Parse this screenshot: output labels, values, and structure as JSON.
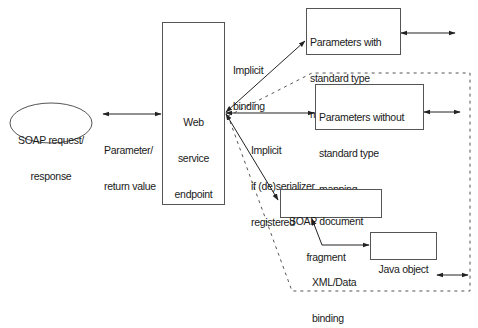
{
  "diagram": {
    "nodes": {
      "soap_request": {
        "label_line1": "SOAP request/",
        "label_line2": "response",
        "shape": "ellipse"
      },
      "endpoint": {
        "label_line1": "Web",
        "label_line2": "service",
        "label_line3": "endpoint",
        "shape": "rect"
      },
      "params_standard": {
        "label_line1": "Parameters with",
        "label_line2": "standard type",
        "label_line3": "mapping",
        "shape": "rect"
      },
      "params_nonstandard": {
        "label_line1": "Parameters without",
        "label_line2": "standard type",
        "label_line3": "mapping",
        "shape": "rect"
      },
      "soap_fragment": {
        "label_line1": "SOAP document",
        "label_line2": "fragment",
        "shape": "rect"
      },
      "java_object": {
        "label_line1": "Java object",
        "shape": "rect"
      }
    },
    "edges": {
      "soap_to_endpoint": {
        "label_line1": "Parameter/",
        "label_line2": "return value",
        "style": "solid",
        "direction": "both"
      },
      "endpoint_to_standard": {
        "label_line1": "Implicit",
        "label_line2": "binding",
        "style": "solid",
        "direction": "both"
      },
      "endpoint_to_nonstandard": {
        "label_line1": "Implicit",
        "label_line2": "if (de)serializer",
        "label_line3": "registered",
        "style": "solid",
        "direction": "both"
      },
      "endpoint_to_fragment": {
        "style": "solid",
        "direction": "both"
      },
      "fragment_to_java": {
        "label_line1": "XML/Data",
        "label_line2": "binding",
        "style": "solid",
        "direction": "both"
      },
      "standard_out": {
        "style": "solid",
        "direction": "both"
      },
      "nonstandard_out": {
        "style": "solid",
        "direction": "both"
      },
      "java_out": {
        "style": "solid",
        "direction": "both"
      }
    },
    "group": {
      "name": "non-standard-types-region",
      "style": "dashed"
    },
    "colors": {
      "line": "#222222",
      "box_border": "#555555",
      "dashed": "#555555",
      "text": "#1a1a1a",
      "background": "#ffffff"
    }
  }
}
